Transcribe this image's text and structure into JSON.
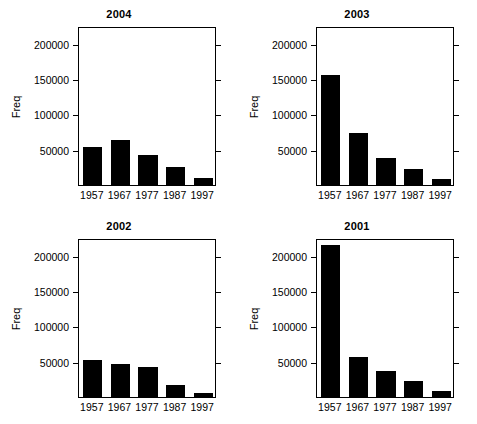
{
  "figure": {
    "width": 477,
    "height": 424,
    "background": "#ffffff",
    "bar_color": "#000000",
    "axis_color": "#000000",
    "layout": "2x2 panel grid"
  },
  "chart_data": [
    {
      "type": "bar",
      "title": "2004",
      "categories": [
        "1957",
        "1967",
        "1977",
        "1987",
        "1997"
      ],
      "values": [
        54000,
        63000,
        43000,
        26000,
        10000
      ],
      "xlabel": "",
      "ylabel": "Freq",
      "ylim": [
        0,
        225000
      ],
      "yticks": [
        50000,
        100000,
        150000,
        200000
      ],
      "ytick_labels": [
        "50000",
        "100000",
        "150000",
        "200000"
      ],
      "grid": false,
      "legend": "none"
    },
    {
      "type": "bar",
      "title": "2003",
      "categories": [
        "1957",
        "1967",
        "1977",
        "1987",
        "1997"
      ],
      "values": [
        156000,
        74000,
        38000,
        23000,
        8000
      ],
      "xlabel": "",
      "ylabel": "Freq",
      "ylim": [
        0,
        225000
      ],
      "yticks": [
        50000,
        100000,
        150000,
        200000
      ],
      "ytick_labels": [
        "50000",
        "100000",
        "150000",
        "200000"
      ],
      "grid": false,
      "legend": "none"
    },
    {
      "type": "bar",
      "title": "2002",
      "categories": [
        "1957",
        "1967",
        "1977",
        "1987",
        "1997"
      ],
      "values": [
        53000,
        47000,
        42000,
        17000,
        6000
      ],
      "xlabel": "",
      "ylabel": "Freq",
      "ylim": [
        0,
        225000
      ],
      "yticks": [
        50000,
        100000,
        150000,
        200000
      ],
      "ytick_labels": [
        "50000",
        "100000",
        "150000",
        "200000"
      ],
      "grid": false,
      "legend": "none"
    },
    {
      "type": "bar",
      "title": "2001",
      "categories": [
        "1957",
        "1967",
        "1977",
        "1987",
        "1997"
      ],
      "values": [
        215000,
        57000,
        37000,
        22000,
        8000
      ],
      "xlabel": "",
      "ylabel": "Freq",
      "ylim": [
        0,
        225000
      ],
      "yticks": [
        50000,
        100000,
        150000,
        200000
      ],
      "ytick_labels": [
        "50000",
        "100000",
        "150000",
        "200000"
      ],
      "grid": false,
      "legend": "none"
    }
  ]
}
